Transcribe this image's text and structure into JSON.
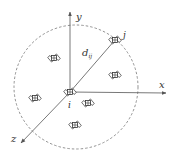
{
  "diagram": {
    "axes": {
      "x_label": "x",
      "y_label": "y",
      "z_label": "z"
    },
    "labels": {
      "origin_node": "i",
      "target_node": "j",
      "distance": "d",
      "distance_subscript": "ij"
    },
    "colors": {
      "axis": "#555555",
      "circle": "#777777",
      "satellite": "#444444"
    },
    "satellites": [
      {
        "id": "i",
        "x": 70,
        "y": 92
      },
      {
        "id": "j",
        "x": 115,
        "y": 40
      },
      {
        "id": "s1",
        "x": 54,
        "y": 58
      },
      {
        "id": "s2",
        "x": 115,
        "y": 75
      },
      {
        "id": "s3",
        "x": 35,
        "y": 98
      },
      {
        "id": "s4",
        "x": 88,
        "y": 103
      },
      {
        "id": "s5",
        "x": 75,
        "y": 125
      }
    ]
  }
}
